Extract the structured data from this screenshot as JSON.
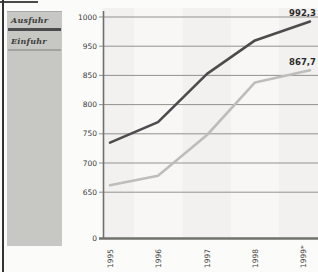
{
  "chart_data": {
    "type": "line",
    "title": "",
    "x": [
      "1995",
      "1996",
      "1997",
      "1998",
      "1999*"
    ],
    "yticks": [
      "1000",
      "950",
      "850",
      "800",
      "750",
      "700",
      "650",
      "0"
    ],
    "ytick_values": [
      1000,
      950,
      850,
      800,
      750,
      700,
      650
    ],
    "axis_quirks": "evenly spaced gridlines, 900 label skipped between 950 and 850, axis breaks down to 0 at bottom",
    "grid": true,
    "legend_position": "left",
    "series": [
      {
        "name": "Ausfuhr",
        "values": [
          735,
          770,
          855,
          960,
          992.3
        ],
        "end_label": "992,3",
        "color": "#4c4c4e"
      },
      {
        "name": "Einfuhr",
        "values": [
          662,
          678,
          748,
          838,
          867.7
        ],
        "end_label": "867,7",
        "color": "#bdbdbb"
      }
    ],
    "colors": {
      "grid": "#91918d",
      "axis": "#70706c",
      "tick_text": "#3b3b39",
      "legend_bg": "#c7c7c3",
      "band_dark": "#f2f1ef",
      "band_light": "#f8f7f5"
    }
  }
}
